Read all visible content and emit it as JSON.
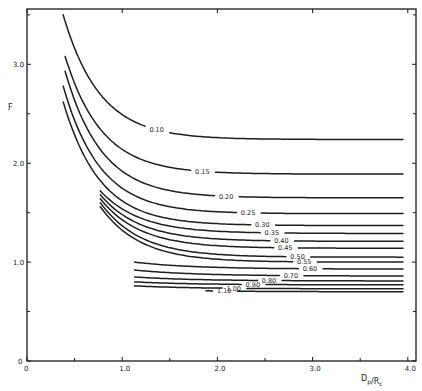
{
  "chart_data": {
    "type": "line",
    "title": "",
    "xlabel": "D_p/R_c",
    "ylabel": "F",
    "xlim": [
      0,
      4.0
    ],
    "ylim": [
      0,
      3.5
    ],
    "x_ticks": [
      0,
      1.0,
      2.0,
      3.0,
      4.0
    ],
    "x_tick_labels": [
      "0",
      "1.0",
      "2.0",
      "3.0",
      "4.0"
    ],
    "x_minor_ticks": [
      0.5,
      1.5,
      2.5,
      3.5
    ],
    "y_ticks": [
      0,
      1.0,
      2.0,
      3.0
    ],
    "y_tick_labels": [
      "0",
      "1.0",
      "2.0",
      "3.0"
    ],
    "y_minor_ticks": [
      0.5,
      1.5,
      2.5,
      3.5
    ],
    "grid": false,
    "legend": "inline curve labels",
    "series": [
      {
        "name": "0.10",
        "x_start": 0.38,
        "F_start": 3.5,
        "x_end": 3.95,
        "F_end": 2.24,
        "label_at_x": 1.37
      },
      {
        "name": "0.15",
        "x_start": 0.4,
        "F_start": 3.08,
        "x_end": 3.95,
        "F_end": 1.89,
        "label_at_x": 1.85
      },
      {
        "name": "0.20",
        "x_start": 0.4,
        "F_start": 2.93,
        "x_end": 3.95,
        "F_end": 1.65,
        "label_at_x": 2.1
      },
      {
        "name": "0.25",
        "x_start": 0.38,
        "F_start": 2.78,
        "x_end": 3.95,
        "F_end": 1.49,
        "label_at_x": 2.33
      },
      {
        "name": "0.30",
        "x_start": 0.38,
        "F_start": 2.62,
        "x_end": 3.95,
        "F_end": 1.37,
        "label_at_x": 2.48
      },
      {
        "name": "0.35",
        "x_start": 0.77,
        "F_start": 1.72,
        "x_end": 3.95,
        "F_end": 1.29,
        "label_at_x": 2.58
      },
      {
        "name": "0.40",
        "x_start": 0.77,
        "F_start": 1.68,
        "x_end": 3.95,
        "F_end": 1.21,
        "label_at_x": 2.68
      },
      {
        "name": "0.45",
        "x_start": 0.77,
        "F_start": 1.64,
        "x_end": 3.95,
        "F_end": 1.14,
        "label_at_x": 2.72
      },
      {
        "name": "0.50",
        "x_start": 0.77,
        "F_start": 1.6,
        "x_end": 3.95,
        "F_end": 1.05,
        "label_at_x": 2.85
      },
      {
        "name": "0.55",
        "x_start": 0.77,
        "F_start": 1.56,
        "x_end": 3.95,
        "F_end": 1.0,
        "label_at_x": 2.92
      },
      {
        "name": "0.60",
        "x_start": 1.13,
        "F_start": 1.0,
        "x_end": 3.95,
        "F_end": 0.93,
        "label_at_x": 2.98
      },
      {
        "name": "0.70",
        "x_start": 1.13,
        "F_start": 0.92,
        "x_end": 3.95,
        "F_end": 0.86,
        "label_at_x": 2.78
      },
      {
        "name": "0.80",
        "x_start": 1.13,
        "F_start": 0.85,
        "x_end": 3.95,
        "F_end": 0.81,
        "label_at_x": 2.55
      },
      {
        "name": "0.90",
        "x_start": 1.13,
        "F_start": 0.8,
        "x_end": 3.95,
        "F_end": 0.77,
        "label_at_x": 2.38
      },
      {
        "name": "1.00",
        "x_start": 1.13,
        "F_start": 0.76,
        "x_end": 3.95,
        "F_end": 0.73,
        "label_at_x": 2.18
      },
      {
        "name": "1.10",
        "x_start": 1.88,
        "F_start": 0.71,
        "x_end": 3.95,
        "F_end": 0.7,
        "label_at_x": 2.08
      }
    ]
  }
}
